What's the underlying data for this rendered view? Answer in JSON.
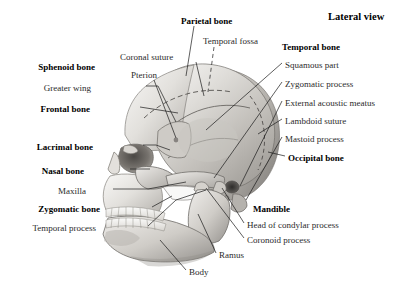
{
  "figure": {
    "view_title": "Lateral view",
    "background_color": "#ffffff",
    "ink_color": "#111111",
    "leader_color": "#1a1a1a"
  },
  "labels": {
    "left": [
      {
        "id": "sphenoid-bone",
        "text": "Sphenoid bone",
        "style": "bold",
        "x": 95,
        "y": 68
      },
      {
        "id": "greater-wing",
        "text": "Greater wing",
        "style": "plain",
        "x": 91,
        "y": 89
      },
      {
        "id": "frontal-bone",
        "text": "Frontal bone",
        "style": "bold",
        "x": 90,
        "y": 110
      },
      {
        "id": "lacrimal-bone",
        "text": "Lacrimal bone",
        "style": "bold",
        "x": 93,
        "y": 148
      },
      {
        "id": "nasal-bone",
        "text": "Nasal bone",
        "style": "bold",
        "x": 84,
        "y": 172
      },
      {
        "id": "maxilla",
        "text": "Maxilla",
        "style": "plain",
        "x": 86,
        "y": 192
      },
      {
        "id": "zygomatic-bone",
        "text": "Zygomatic bone",
        "style": "bold",
        "x": 100,
        "y": 210
      },
      {
        "id": "temporal-process",
        "text": "Temporal process",
        "style": "plain",
        "x": 96,
        "y": 229
      }
    ],
    "top": [
      {
        "id": "parietal-bone",
        "text": "Parietal bone",
        "style": "bold",
        "x": 181,
        "y": 22
      },
      {
        "id": "coronal-suture",
        "text": "Coronal suture",
        "style": "plain",
        "x": 120,
        "y": 58
      },
      {
        "id": "temporal-fossa",
        "text": "Temporal fossa",
        "style": "plain",
        "x": 203,
        "y": 42
      },
      {
        "id": "pterion",
        "text": "Pterion",
        "style": "plain",
        "x": 131,
        "y": 76
      }
    ],
    "right": [
      {
        "id": "temporal-bone",
        "text": "Temporal bone",
        "style": "bold",
        "x": 282,
        "y": 48
      },
      {
        "id": "squamous-part",
        "text": "Squamous part",
        "style": "plain",
        "x": 285,
        "y": 66
      },
      {
        "id": "zygomatic-process",
        "text": "Zygomatic process",
        "style": "plain",
        "x": 285,
        "y": 85
      },
      {
        "id": "external-acoustic-meatus",
        "text": "External acoustic meatus",
        "style": "plain",
        "x": 285,
        "y": 104
      },
      {
        "id": "lambdoid-suture",
        "text": "Lambdoid suture",
        "style": "plain",
        "x": 285,
        "y": 122
      },
      {
        "id": "mastoid-process",
        "text": "Mastoid process",
        "style": "plain",
        "x": 285,
        "y": 140
      },
      {
        "id": "occipital-bone",
        "text": "Occipital bone",
        "style": "bold",
        "x": 288,
        "y": 159
      },
      {
        "id": "mandible",
        "text": "Mandible",
        "style": "bold",
        "x": 253,
        "y": 210
      },
      {
        "id": "head-of-condylar-process",
        "text": "Head of condylar process",
        "style": "plain",
        "x": 247,
        "y": 226
      },
      {
        "id": "coronoid-process",
        "text": "Coronoid process",
        "style": "plain",
        "x": 247,
        "y": 241
      }
    ],
    "bottom": [
      {
        "id": "ramus",
        "text": "Ramus",
        "style": "plain",
        "x": 219,
        "y": 256
      },
      {
        "id": "body",
        "text": "Body",
        "style": "plain",
        "x": 189,
        "y": 273
      }
    ]
  }
}
